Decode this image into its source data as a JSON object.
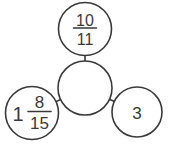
{
  "diagram": {
    "kind": "number-bond-circles",
    "ink_color": "#3a3a3a",
    "background_color": "#ffffff"
  },
  "nodes": {
    "top": {
      "type": "fraction",
      "numerator": "10",
      "denominator": "11"
    },
    "center": {
      "type": "empty",
      "value": ""
    },
    "bottom_left": {
      "type": "mixed_number",
      "whole": "1",
      "numerator": "8",
      "denominator": "15"
    },
    "bottom_right": {
      "type": "whole_number",
      "value": "3"
    }
  }
}
